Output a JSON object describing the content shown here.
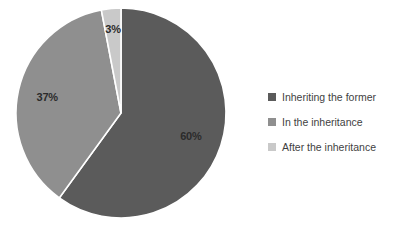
{
  "chart_data": {
    "type": "pie",
    "title": "",
    "categories": [
      "Inheriting the former",
      "In the inheritance",
      "After the inheritance"
    ],
    "values": [
      60,
      37,
      3
    ],
    "data_labels": [
      "60%",
      "37%",
      "3%"
    ],
    "unit": "%",
    "colors": [
      "#5b5b5b",
      "#8f8f8f",
      "#c9c9c9"
    ],
    "legend_position": "right",
    "grid": false,
    "slice_border_color": "#ffffff",
    "start_angle_deg": 0,
    "direction": "clockwise",
    "background": "#ffffff",
    "label_color": "#2b2b2b"
  },
  "legend": {
    "items": [
      {
        "label": "Inheriting the former",
        "color": "#5b5b5b"
      },
      {
        "label": "In the inheritance",
        "color": "#8f8f8f"
      },
      {
        "label": "After the inheritance",
        "color": "#c9c9c9"
      }
    ]
  },
  "labels": {
    "slice_0": "60%",
    "slice_1": "37%",
    "slice_2": "3%"
  }
}
